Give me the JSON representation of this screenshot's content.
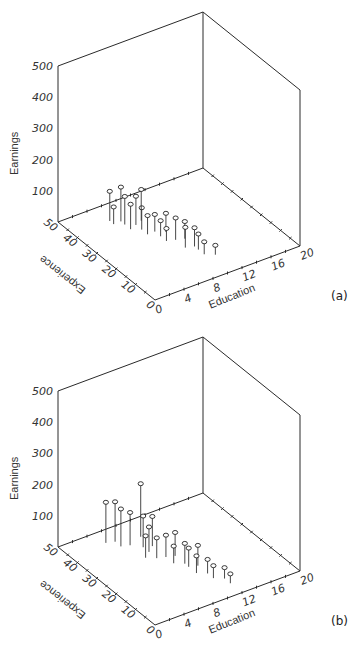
{
  "chart_data": [
    {
      "type": "scatter",
      "subtype": "3d-scatter-with-drop-lines",
      "panel_label": "(a)",
      "zlabel": "Earnings",
      "xlabel": "Education",
      "ylabel": "Experience",
      "zlim": [
        0,
        500
      ],
      "xlim": [
        0,
        20
      ],
      "ylim": [
        0,
        50
      ],
      "z_ticks": [
        "100",
        "200",
        "300",
        "400",
        "500"
      ],
      "x_ticks": [
        "0",
        "4",
        "8",
        "12",
        "16",
        "20"
      ],
      "y_ticks": [
        "0",
        "10",
        "20",
        "30",
        "40",
        "50"
      ],
      "points": [
        {
          "education": 6,
          "experience": 40,
          "earnings": 110
        },
        {
          "education": 5,
          "experience": 42,
          "earnings": 95
        },
        {
          "education": 6,
          "experience": 38,
          "earnings": 90
        },
        {
          "education": 7,
          "experience": 36,
          "earnings": 92
        },
        {
          "education": 6,
          "experience": 35,
          "earnings": 80
        },
        {
          "education": 7,
          "experience": 33,
          "earnings": 70
        },
        {
          "education": 8,
          "experience": 37,
          "earnings": 100
        },
        {
          "education": 5,
          "experience": 40,
          "earnings": 55
        },
        {
          "education": 7,
          "experience": 30,
          "earnings": 60
        },
        {
          "education": 8,
          "experience": 30,
          "earnings": 55
        },
        {
          "education": 9,
          "experience": 28,
          "earnings": 60
        },
        {
          "education": 8,
          "experience": 27,
          "earnings": 50
        },
        {
          "education": 8,
          "experience": 24,
          "earnings": 40
        },
        {
          "education": 9,
          "experience": 23,
          "earnings": 70
        },
        {
          "education": 10,
          "experience": 22,
          "earnings": 55
        },
        {
          "education": 9,
          "experience": 18,
          "earnings": 65
        },
        {
          "education": 10,
          "experience": 17,
          "earnings": 60
        },
        {
          "education": 10,
          "experience": 15,
          "earnings": 50
        },
        {
          "education": 10,
          "experience": 12,
          "earnings": 40
        },
        {
          "education": 11,
          "experience": 10,
          "earnings": 30
        }
      ]
    },
    {
      "type": "scatter",
      "subtype": "3d-scatter-with-drop-lines",
      "panel_label": "(b)",
      "zlabel": "Earnings",
      "xlabel": "Education",
      "ylabel": "Experience",
      "zlim": [
        0,
        500
      ],
      "xlim": [
        0,
        20
      ],
      "ylim": [
        0,
        50
      ],
      "z_ticks": [
        "100",
        "200",
        "300",
        "400",
        "500"
      ],
      "x_ticks": [
        "0",
        "4",
        "8",
        "12",
        "16",
        "20"
      ],
      "y_ticks": [
        "0",
        "10",
        "20",
        "30",
        "40",
        "50"
      ],
      "points": [
        {
          "education": 5,
          "experience": 44,
          "earnings": 130
        },
        {
          "education": 6,
          "experience": 43,
          "earnings": 128
        },
        {
          "education": 6,
          "experience": 40,
          "earnings": 120
        },
        {
          "education": 7,
          "experience": 39,
          "earnings": 105
        },
        {
          "education": 9,
          "experience": 41,
          "earnings": 170
        },
        {
          "education": 8,
          "experience": 36,
          "earnings": 100
        },
        {
          "education": 9,
          "experience": 35,
          "earnings": 95
        },
        {
          "education": 8,
          "experience": 33,
          "earnings": 80
        },
        {
          "education": 7,
          "experience": 31,
          "earnings": 70
        },
        {
          "education": 8,
          "experience": 29,
          "earnings": 65
        },
        {
          "education": 9,
          "experience": 28,
          "earnings": 70
        },
        {
          "education": 10,
          "experience": 27,
          "earnings": 75
        },
        {
          "education": 9,
          "experience": 24,
          "earnings": 55
        },
        {
          "education": 10,
          "experience": 22,
          "earnings": 65
        },
        {
          "education": 10,
          "experience": 20,
          "earnings": 60
        },
        {
          "education": 11,
          "experience": 19,
          "earnings": 65
        },
        {
          "education": 10,
          "experience": 16,
          "earnings": 55
        },
        {
          "education": 11,
          "experience": 14,
          "earnings": 45
        },
        {
          "education": 11,
          "experience": 11,
          "earnings": 40
        },
        {
          "education": 12,
          "experience": 9,
          "earnings": 35
        },
        {
          "education": 12,
          "experience": 6,
          "earnings": 30
        }
      ]
    }
  ]
}
